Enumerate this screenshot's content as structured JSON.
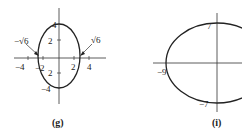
{
  "figures": [
    {
      "caption": "(g)",
      "y_ticks": {
        "top": "4",
        "mid_up": "2",
        "mid_down": "2",
        "bottom": "−4"
      },
      "x_ticks": {
        "neg4": "−4",
        "neg2": "−2",
        "pos2": "2",
        "pos4": "4"
      },
      "annotations": {
        "left": "−√6",
        "right": "√6"
      }
    },
    {
      "caption": "(i)",
      "labels": {
        "top": "7",
        "left": "−9",
        "bottom": "−7"
      }
    }
  ],
  "colors": {
    "stroke": "#222222",
    "background": "#ffffff"
  }
}
